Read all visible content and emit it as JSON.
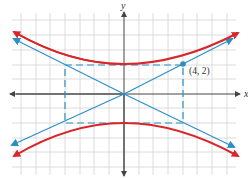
{
  "diagram": {
    "type": "hyperbola",
    "equation": "y^2/4 - x^2/16 = 1",
    "axes": {
      "x_label": "x",
      "y_label": "y"
    },
    "point": {
      "label": "(4, 2)",
      "x": 4,
      "y": 2
    },
    "asymptotes": [
      "y = x/2",
      "y = -x/2"
    ],
    "rectangle": {
      "x_min": -4,
      "x_max": 4,
      "y_min": -2,
      "y_max": 2
    },
    "grid": {
      "x_range": [
        -7,
        7
      ],
      "y_range": [
        -5,
        5
      ],
      "unit": 1
    },
    "colors": {
      "curve": "#d9262b",
      "asymptote": "#2a8fc7",
      "grid": "#d0d0d0",
      "axis": "#444444"
    }
  }
}
